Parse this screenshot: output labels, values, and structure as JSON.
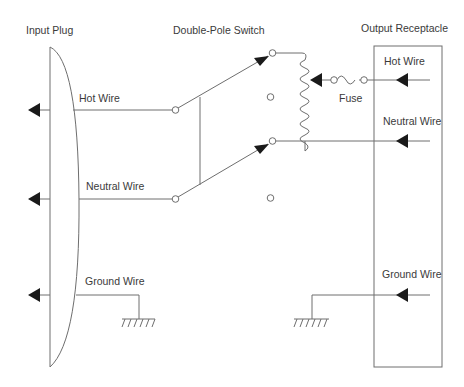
{
  "labels": {
    "input_plug": "Input Plug",
    "double_pole_switch": "Double-Pole Switch",
    "output_receptacle": "Output Receptacle",
    "left_hot_wire": "Hot Wire",
    "left_neutral_wire": "Neutral Wire",
    "left_ground_wire": "Ground Wire",
    "right_hot_wire": "Hot Wire",
    "right_neutral_wire": "Neutral Wire",
    "right_ground_wire": "Ground Wire",
    "fuse": "Fuse"
  },
  "colors": {
    "line": "#6e6e6e",
    "arrow": "#1a1a1a",
    "text": "#3a3a3a",
    "background": "#ffffff"
  },
  "icons": {
    "terminal_arrow": "filled-left-triangle",
    "contact": "open-circle",
    "ground": "hatched-ground-symbol",
    "coil": "inductor-coil",
    "fuse": "fuse-symbol"
  }
}
